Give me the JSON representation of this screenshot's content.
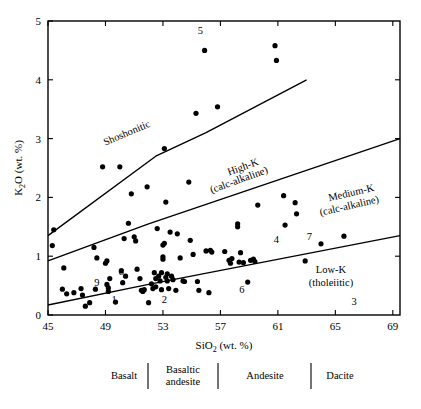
{
  "figure": {
    "background_color": "#ffffff",
    "ink_color": "#000000"
  },
  "axes": {
    "x_title_main": "SiO",
    "x_title_sub": "2",
    "x_title_tail": " (wt. %)",
    "y_title_main": "K",
    "y_title_sub": "2",
    "y_title_tail": "O (wt. %)",
    "x_ticklabels": [
      "45",
      "49",
      "53",
      "57",
      "61",
      "65",
      "69"
    ],
    "y_ticklabels": [
      "0",
      "1",
      "2",
      "3",
      "4",
      "5"
    ]
  },
  "field_labels": {
    "shoshonitic": "Shoshonitic",
    "high_k_line1": "High-K",
    "high_k_line2": "(calc-alkaline)",
    "medium_k_line1": "Medium-K",
    "medium_k_line2": "(calc-alkaline)",
    "low_k_line1": "Low-K",
    "low_k_line2": "(tholeiitic)"
  },
  "annotations": [
    {
      "label": "5",
      "x": 55.6,
      "y": 4.78
    },
    {
      "label": "8",
      "x": 50.1,
      "y": 0.68
    },
    {
      "label": "9",
      "x": 48.4,
      "y": 0.49
    },
    {
      "label": "1",
      "x": 49.6,
      "y": 0.21
    },
    {
      "label": "2",
      "x": 53.1,
      "y": 0.2
    },
    {
      "label": "4",
      "x": 60.9,
      "y": 1.22
    },
    {
      "label": "7",
      "x": 63.2,
      "y": 1.27
    },
    {
      "label": "6",
      "x": 58.5,
      "y": 0.38
    },
    {
      "label": "3",
      "x": 66.3,
      "y": 0.17
    }
  ],
  "rock_classification": {
    "items": [
      {
        "label": "Basalt"
      },
      {
        "label_line1": "Basaltic",
        "label_line2": "andesite"
      },
      {
        "label": "Andesite"
      },
      {
        "label": "Dacite"
      }
    ]
  },
  "chart_data": {
    "type": "scatter",
    "title": "",
    "xlabel": "SiO2 (wt. %)",
    "ylabel": "K2O (wt. %)",
    "xlim": [
      45,
      69.5
    ],
    "ylim": [
      0,
      5
    ],
    "xticks": [
      45,
      49,
      53,
      57,
      61,
      65,
      69
    ],
    "yticks": [
      0,
      1,
      2,
      3,
      4,
      5
    ],
    "grid": false,
    "legend": "none",
    "series": [
      {
        "name": "samples",
        "marker": "filled-circle",
        "color": "#000000",
        "points": [
          [
            45.3,
            1.18
          ],
          [
            45.4,
            1.45
          ],
          [
            46.1,
            0.8
          ],
          [
            46.0,
            0.44
          ],
          [
            46.3,
            0.36
          ],
          [
            46.8,
            0.38
          ],
          [
            47.3,
            0.45
          ],
          [
            47.4,
            0.34
          ],
          [
            47.6,
            0.15
          ],
          [
            47.9,
            0.21
          ],
          [
            48.2,
            1.15
          ],
          [
            48.3,
            0.44
          ],
          [
            48.4,
            0.97
          ],
          [
            48.8,
            2.52
          ],
          [
            49.0,
            0.88
          ],
          [
            49.1,
            0.92
          ],
          [
            49.1,
            0.52
          ],
          [
            49.2,
            0.46
          ],
          [
            49.2,
            0.4
          ],
          [
            49.3,
            0.62
          ],
          [
            49.7,
            0.22
          ],
          [
            50.0,
            2.52
          ],
          [
            50.1,
            0.75
          ],
          [
            50.2,
            0.55
          ],
          [
            50.3,
            1.3
          ],
          [
            50.4,
            0.66
          ],
          [
            50.6,
            1.56
          ],
          [
            50.8,
            2.06
          ],
          [
            51.0,
            1.33
          ],
          [
            51.1,
            1.26
          ],
          [
            51.2,
            0.78
          ],
          [
            51.4,
            0.62
          ],
          [
            51.5,
            0.42
          ],
          [
            51.6,
            0.4
          ],
          [
            51.7,
            0.43
          ],
          [
            51.9,
            2.18
          ],
          [
            52.0,
            0.21
          ],
          [
            52.2,
            0.53
          ],
          [
            52.3,
            0.45
          ],
          [
            52.4,
            0.72
          ],
          [
            52.5,
            0.62
          ],
          [
            52.5,
            0.48
          ],
          [
            52.6,
            1.47
          ],
          [
            52.7,
            0.66
          ],
          [
            52.8,
            0.58
          ],
          [
            52.9,
            0.72
          ],
          [
            52.9,
            0.43
          ],
          [
            53.0,
            0.99
          ],
          [
            53.0,
            0.95
          ],
          [
            53.0,
            1.19
          ],
          [
            53.1,
            1.22
          ],
          [
            53.1,
            2.83
          ],
          [
            53.2,
            1.92
          ],
          [
            53.2,
            0.64
          ],
          [
            53.3,
            0.7
          ],
          [
            53.3,
            0.58
          ],
          [
            53.4,
            0.45
          ],
          [
            53.5,
            1.41
          ],
          [
            53.6,
            0.66
          ],
          [
            53.7,
            0.6
          ],
          [
            53.9,
            0.42
          ],
          [
            54.0,
            1.38
          ],
          [
            54.2,
            0.97
          ],
          [
            54.4,
            0.58
          ],
          [
            54.5,
            0.57
          ],
          [
            54.8,
            2.26
          ],
          [
            54.9,
            1.27
          ],
          [
            55.1,
            1.03
          ],
          [
            55.3,
            3.43
          ],
          [
            55.4,
            0.57
          ],
          [
            55.5,
            0.42
          ],
          [
            55.9,
            4.5
          ],
          [
            56.0,
            1.09
          ],
          [
            56.2,
            0.38
          ],
          [
            56.3,
            1.1
          ],
          [
            56.4,
            1.07
          ],
          [
            56.8,
            3.54
          ],
          [
            57.3,
            1.08
          ],
          [
            57.6,
            0.93
          ],
          [
            57.7,
            0.88
          ],
          [
            57.8,
            0.96
          ],
          [
            58.2,
            1.55
          ],
          [
            58.2,
            1.5
          ],
          [
            58.3,
            0.9
          ],
          [
            58.4,
            1.06
          ],
          [
            58.6,
            0.89
          ],
          [
            58.9,
            0.56
          ],
          [
            59.1,
            0.93
          ],
          [
            59.3,
            0.95
          ],
          [
            59.4,
            0.91
          ],
          [
            59.6,
            1.87
          ],
          [
            60.8,
            4.58
          ],
          [
            60.9,
            4.33
          ],
          [
            61.4,
            2.03
          ],
          [
            61.5,
            1.53
          ],
          [
            62.2,
            1.91
          ],
          [
            62.3,
            1.72
          ],
          [
            62.9,
            0.92
          ],
          [
            64.0,
            1.21
          ],
          [
            65.6,
            1.34
          ]
        ]
      }
    ],
    "boundary_lines": [
      {
        "name": "shoshonitic-high-k-boundary",
        "vertices": [
          [
            45,
            1.35
          ],
          [
            52.5,
            2.7
          ],
          [
            56.0,
            3.1
          ],
          [
            63.0,
            4.0
          ]
        ]
      },
      {
        "name": "high-k-medium-k-boundary",
        "vertices": [
          [
            45,
            0.92
          ],
          [
            52.0,
            1.55
          ],
          [
            69.5,
            3.0
          ]
        ]
      },
      {
        "name": "medium-k-low-k-boundary",
        "vertices": [
          [
            45,
            0.17
          ],
          [
            52.0,
            0.52
          ],
          [
            69.5,
            1.35
          ]
        ]
      }
    ]
  }
}
